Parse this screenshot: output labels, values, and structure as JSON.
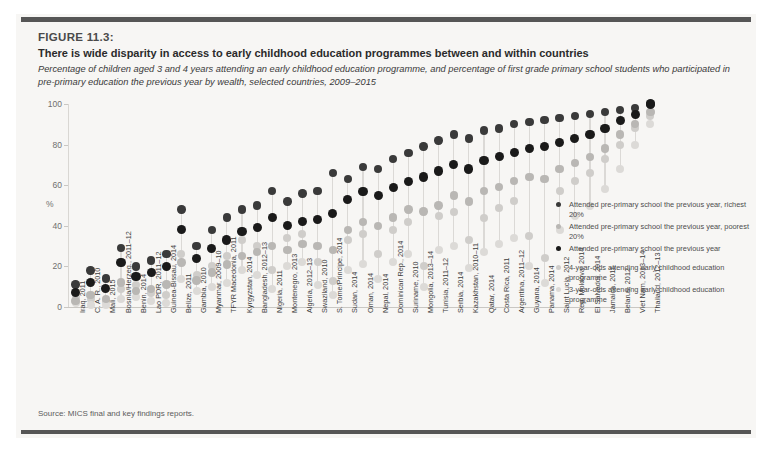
{
  "figure": {
    "number": "FIGURE 11.3:",
    "title": "There is wide disparity in access to early childhood education programmes between and within countries",
    "subtitle": "Percentage of children aged 3 and 4 years attending an early childhood education programme, and percentage of first grade primary school students who participated in pre-primary education the previous year by wealth, selected countries, 2009–2015",
    "source": "Source: MICS final and key findings reports."
  },
  "colors": {
    "panel_bg": "#f7f6f4",
    "rule": "#565656",
    "dark_dot": "#1a1a1a",
    "mid_dot": "#8f8f8f",
    "light_dot": "#d2d0cd",
    "lighter_dot": "#e0dedb",
    "stem": "#dbd9d6",
    "axis": "#c9c7c3",
    "text": "#3d3d3d"
  },
  "legend": {
    "position": "right-inside",
    "entries": [
      {
        "label": "Attended pre-primary school the previous year, richest 20%",
        "color": "#3a3a3a",
        "gap_before": false
      },
      {
        "label": "Attended pre-primary school the previous year, poorest 20%",
        "color": "#b9b7b4",
        "gap_before": false
      },
      {
        "label": "Attended pre-primary school the previous year",
        "color": "#1a1a1a",
        "gap_before": false
      },
      {
        "label": "4-year-olds attending early childhood education programme",
        "color": "#cfcdca",
        "gap_before": true
      },
      {
        "label": "3-year-olds attending early childhood education programme",
        "color": "#dcdad7",
        "gap_before": false
      }
    ]
  },
  "chart_data": {
    "type": "scatter",
    "chart_subtype": "dumbbell-range",
    "title": "There is wide disparity in access to early childhood education programmes between and within countries",
    "xlabel": "",
    "ylabel": "%",
    "ylim": [
      0,
      100
    ],
    "yticks": [
      0,
      20,
      40,
      60,
      80,
      100
    ],
    "grid": false,
    "categories": [
      "Iraq, 2011",
      "C. A. R., 2010",
      "Mali, 2015",
      "Bosnia/Herzeg., 2011–12",
      "Benin, 2014",
      "Lao PDR, 2011–12",
      "Guinea-Bissau, 2014",
      "Belize, 2011",
      "Gambia, 2010",
      "Myanmar, 2009–10",
      "TFYR Macedonia, 2011",
      "Kyrgyzstan, 2014",
      "Bangladesh, 2012–13",
      "Nigeria, 2011",
      "Montenegro, 2013",
      "Algeria, 2012–13",
      "Swaziland, 2010",
      "S. Tome/Principe, 2014",
      "Sudan, 2014",
      "Oman, 2014",
      "Nepal, 2014",
      "Dominican Rep., 2014",
      "Suriname, 2010",
      "Mongolia, 2013–14",
      "Tunisia, 2011–12",
      "Serbia, 2014",
      "Kazakhstan, 2010–11",
      "Qatar, 2014",
      "Costa Rica, 2011",
      "Argentina, 2011–12",
      "Guyana, 2014",
      "Panama, 2014",
      "Saint Lucia, 2012",
      "Rep. Moldova, 2014",
      "El Salvador, 2014",
      "Jamaica, 2011",
      "Belarus, 2012",
      "Viet Nam, 2013–14",
      "Thailand, 2012–13"
    ],
    "series": [
      {
        "name": "Attended pre-primary school the previous year",
        "color": "#1a1a1a",
        "values": [
          7,
          12,
          9,
          22,
          15,
          17,
          20,
          38,
          24,
          29,
          33,
          37,
          39,
          44,
          40,
          42,
          43,
          46,
          53,
          57,
          55,
          59,
          62,
          64,
          67,
          70,
          68,
          72,
          74,
          76,
          78,
          79,
          81,
          83,
          85,
          88,
          92,
          95,
          100
        ]
      },
      {
        "name": "Attended pre-primary school the previous year, richest 20%",
        "color": "#3a3a3a",
        "values": [
          11,
          18,
          14,
          29,
          20,
          23,
          26,
          48,
          30,
          38,
          44,
          48,
          50,
          57,
          52,
          56,
          57,
          66,
          63,
          69,
          68,
          73,
          76,
          79,
          82,
          85,
          83,
          87,
          88,
          90,
          91,
          92,
          93,
          94,
          95,
          96,
          97,
          98,
          100
        ]
      },
      {
        "name": "Attended pre-primary school the previous year, poorest 20%",
        "color": "#b9b7b4",
        "values": [
          3,
          6,
          4,
          12,
          8,
          9,
          11,
          22,
          13,
          17,
          21,
          25,
          27,
          30,
          28,
          31,
          30,
          28,
          38,
          42,
          40,
          44,
          48,
          47,
          50,
          55,
          52,
          57,
          59,
          62,
          64,
          63,
          68,
          71,
          74,
          78,
          85,
          90,
          96
        ]
      },
      {
        "name": "4-year-olds attending early childhood education programme",
        "color": "#cfcdca",
        "values": [
          5,
          4,
          3,
          9,
          11,
          7,
          6,
          26,
          16,
          20,
          25,
          33,
          30,
          18,
          34,
          36,
          22,
          13,
          33,
          36,
          26,
          38,
          42,
          20,
          45,
          47,
          33,
          44,
          49,
          52,
          35,
          24,
          57,
          62,
          66,
          73,
          80,
          88,
          94
        ]
      },
      {
        "name": "3-year-olds attending early childhood education programme",
        "color": "#dcdad7",
        "values": [
          2,
          1,
          1,
          4,
          5,
          3,
          2,
          14,
          8,
          10,
          12,
          18,
          16,
          9,
          20,
          22,
          11,
          6,
          18,
          21,
          14,
          22,
          26,
          10,
          28,
          30,
          19,
          27,
          31,
          34,
          20,
          12,
          38,
          45,
          50,
          58,
          68,
          80,
          90
        ]
      }
    ]
  }
}
